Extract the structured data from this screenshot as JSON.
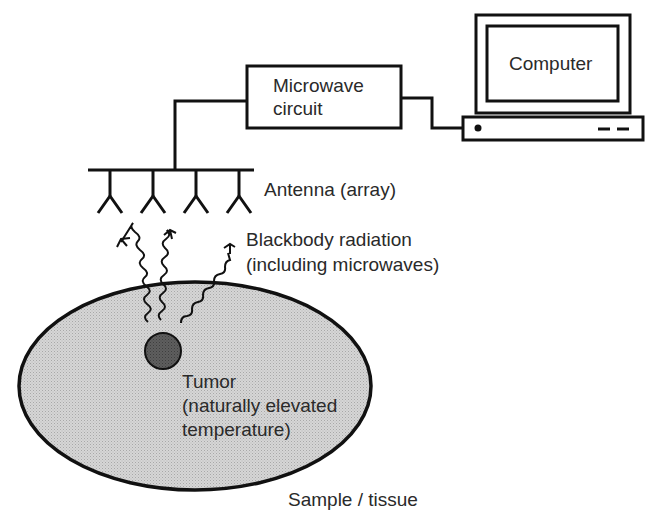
{
  "diagram": {
    "nodes": {
      "microwave_circuit": {
        "line1": "Microwave",
        "line2": "circuit"
      },
      "computer": {
        "label": "Computer"
      },
      "antenna": {
        "label": "Antenna (array)",
        "count": 4
      },
      "radiation": {
        "line1": "Blackbody radiation",
        "line2": "(including microwaves)"
      },
      "tumor": {
        "line1": "Tumor",
        "line2": "(naturally elevated",
        "line3": "temperature)"
      },
      "sample": {
        "label": "Sample / tissue"
      }
    },
    "edges": [
      {
        "from": "antenna",
        "to": "microwave_circuit"
      },
      {
        "from": "microwave_circuit",
        "to": "computer"
      },
      {
        "from": "tumor",
        "to": "antenna",
        "type": "wavy-arrow",
        "count": 3
      }
    ],
    "colors": {
      "stroke": "#111111",
      "tissue_fill": "#cfcfcf",
      "tumor_fill": "#5a5a5a",
      "text": "#2a2a2a"
    }
  }
}
